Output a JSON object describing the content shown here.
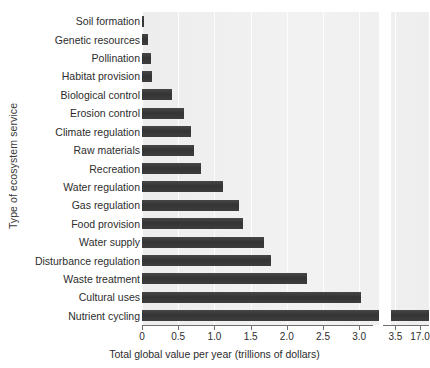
{
  "chart_data": {
    "type": "bar",
    "orientation": "horizontal",
    "title": "",
    "xlabel": "Total global value per year (trillions of dollars)",
    "ylabel": "Type of ecosystem service",
    "categories": [
      "Soil formation",
      "Genetic resources",
      "Pollination",
      "Habitat provision",
      "Biological control",
      "Erosion control",
      "Climate regulation",
      "Raw materials",
      "Recreation",
      "Water regulation",
      "Gas regulation",
      "Food provision",
      "Water supply",
      "Disturbance regulation",
      "Waste treatment",
      "Cultural uses",
      "Nutrient cycling"
    ],
    "values": [
      0.03,
      0.08,
      0.12,
      0.14,
      0.42,
      0.58,
      0.68,
      0.72,
      0.82,
      1.12,
      1.34,
      1.39,
      1.69,
      1.78,
      2.28,
      3.02,
      17.08
    ],
    "xtick_labels": [
      "0",
      "0.5",
      "1.0",
      "1.5",
      "2.0",
      "2.5",
      "3.0",
      "3.5",
      "17.0"
    ],
    "xtick_values": [
      0,
      0.5,
      1.0,
      1.5,
      2.0,
      2.5,
      3.0,
      3.5,
      17.0
    ],
    "xlim": [
      0,
      3.7
    ],
    "axis_break": {
      "present": true,
      "after_value": 3.6,
      "resumes_at_value": 17.0,
      "style": "wavy-vertical"
    },
    "grid": "vertical-light",
    "legend": "none",
    "bar_color": "#3a3a3a",
    "plot_background": "#efefef"
  }
}
